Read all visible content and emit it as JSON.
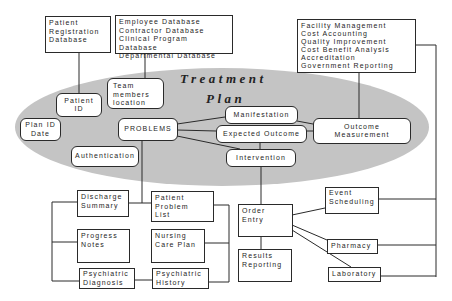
{
  "colors": {
    "ellipse_fill": "#c4c4c4",
    "line": "#2a2a2a",
    "box_fill": "#ffffff",
    "text": "#1e1e1e"
  },
  "ellipse": {
    "title_line1": "Treatment",
    "title_line2": "Plan"
  },
  "top_boxes": {
    "patient_registration": "Patient\nRegistration\nDatabase",
    "staff_databases": "Employee Database\nContractor Database\nClinical Program Database\nDepartmental Database",
    "administration": "Facility Management\nCost Accounting\nQuality Improvement\nCost Benefit Analysis\nAccreditation\nGovernment Reporting"
  },
  "plan_nodes": {
    "team_members": "Team\nmembers\nlocation",
    "patient_id": "Patient\nID",
    "plan_id_date": "Plan ID\nDate",
    "problems": "PROBLEMS",
    "authentication": "Authentication",
    "manifestation": "Manifestation",
    "expected_outcome": "Expected Outcome",
    "intervention": "Intervention",
    "outcome_measurement": "Outcome\nMeasurement"
  },
  "clinical_docs": {
    "discharge_summary": "Discharge\nSummary",
    "patient_problem_list": "Patient\nProblem\nList",
    "progress_notes": "Progress\nNotes",
    "nursing_care_plan": "Nursing\nCare Plan",
    "psychiatric_diagnosis": "Psychiatric\nDiagnosis",
    "psychiatric_history": "Psychiatric\nHistory"
  },
  "orders": {
    "order_entry": "Order\nEntry",
    "results_reporting": "Results\nReporting",
    "event_scheduling": "Event\nScheduling",
    "pharmacy": "Pharmacy",
    "laboratory": "Laboratory"
  }
}
